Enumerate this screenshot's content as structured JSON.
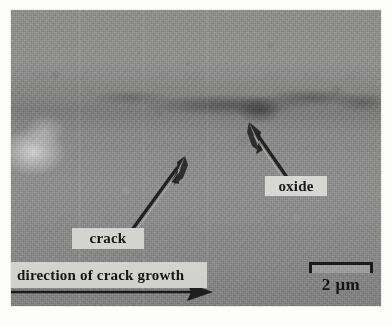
{
  "figure": {
    "type": "sem-micrograph",
    "plate": {
      "x": 11,
      "y": 10,
      "width": 370,
      "height": 296,
      "base_color": "#8d8d8d",
      "tone_range": [
        "#6f6f6f",
        "#b4b4b4"
      ]
    }
  },
  "annotations": {
    "crack_label": "crack",
    "oxide_label": "oxide",
    "direction_banner": "direction of crack growth",
    "label_box_color": "#dededa",
    "label_text_color": "#141414",
    "arrow_color": "#1a1a1a"
  },
  "scale_bar": {
    "caption": "2 μm",
    "value": 2,
    "unit": "μm",
    "bar_length_px": 64,
    "color": "#1a1a1a"
  },
  "arrows": [
    {
      "name": "crack-arrow",
      "from": [
        118,
        222
      ],
      "to": [
        172,
        150
      ],
      "points_to": "crack",
      "style": "solid-tapered"
    },
    {
      "name": "oxide-arrow",
      "from": [
        280,
        176
      ],
      "to": [
        240,
        118
      ],
      "points_to": "oxide",
      "style": "solid-tapered"
    },
    {
      "name": "direction-arrow",
      "from": [
        2,
        282
      ],
      "to": [
        192,
        282
      ],
      "points_to": "direction of crack growth",
      "style": "horizontal-line"
    }
  ],
  "page_bleed": {
    "top_ghost": "                       ",
    "bottom_ghost": "                    "
  }
}
